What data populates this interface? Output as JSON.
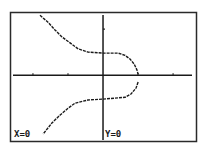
{
  "chart_data": {
    "type": "line",
    "title": "",
    "xlabel": "",
    "ylabel": "",
    "xlim": [
      -2.57,
      2.54
    ],
    "ylim": [
      -1.43,
      1.35
    ],
    "x_tick_step": 1,
    "y_tick_step": 1,
    "x_ticks": [
      -2,
      -1,
      0,
      1,
      2
    ],
    "y_ticks": [
      1
    ],
    "grid": false,
    "frame": true,
    "colors": {
      "curve": "#1a1a1a",
      "axes": "#1a1a1a",
      "frame": "#2a2a2a",
      "background": "#ffffff"
    },
    "series": [
      {
        "name": "upper-branch",
        "points": [
          [
            -1.8,
            1.3
          ],
          [
            -1.57,
            1.15
          ],
          [
            -1.37,
            0.98
          ],
          [
            -1.17,
            0.83
          ],
          [
            -0.94,
            0.7
          ],
          [
            -0.71,
            0.57
          ],
          [
            -0.43,
            0.5
          ],
          [
            0.0,
            0.48
          ],
          [
            0.43,
            0.48
          ],
          [
            0.63,
            0.43
          ],
          [
            0.77,
            0.35
          ],
          [
            0.89,
            0.24
          ],
          [
            0.97,
            0.11
          ],
          [
            1.0,
            0.02
          ]
        ]
      },
      {
        "name": "lower-branch",
        "points": [
          [
            1.0,
            -0.15
          ],
          [
            0.94,
            -0.28
          ],
          [
            0.8,
            -0.41
          ],
          [
            0.63,
            -0.48
          ],
          [
            0.0,
            -0.52
          ],
          [
            -0.43,
            -0.54
          ],
          [
            -0.8,
            -0.61
          ],
          [
            -1.0,
            -0.72
          ],
          [
            -1.23,
            -0.87
          ],
          [
            -1.46,
            -1.04
          ],
          [
            -1.71,
            -1.28
          ]
        ]
      }
    ],
    "cursor_readout": {
      "x_label": "X=0",
      "y_label": "Y=0"
    }
  }
}
